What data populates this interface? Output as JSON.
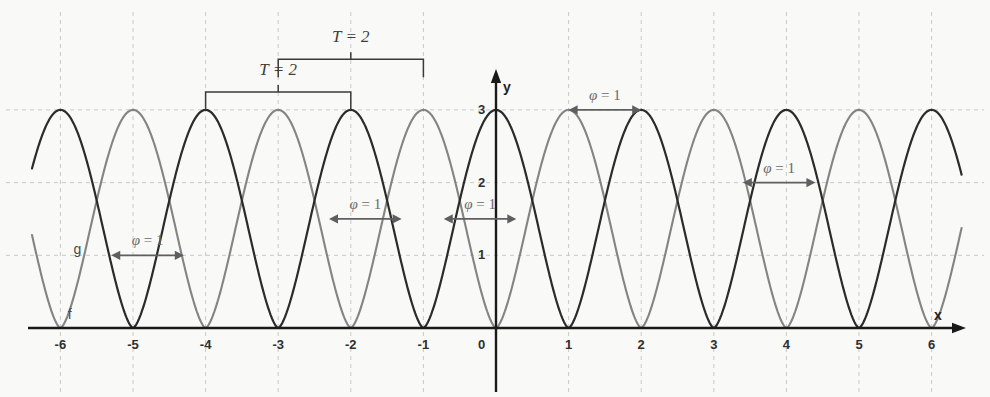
{
  "figure": {
    "background_color": "#f9f9f7",
    "axis_color": "#1a1a1a",
    "grid_color": "#c9c9c9",
    "x_axis_label": "x",
    "y_axis_label": "y",
    "curve_f": {
      "name": "f",
      "color": "#2b2b2b"
    },
    "curve_g": {
      "name": "g",
      "color": "#7d7d7d"
    }
  },
  "chart_data": {
    "type": "line",
    "title": "",
    "xlabel": "x",
    "ylabel": "y",
    "xlim": [
      -6.6,
      6.6
    ],
    "ylim": [
      0,
      3.3
    ],
    "grid": true,
    "legend_position": "inline-left",
    "x_ticks": [
      "-6",
      "-5",
      "-4",
      "-3",
      "-2",
      "-1",
      "0",
      "1",
      "2",
      "3",
      "4",
      "5",
      "6"
    ],
    "x_tick_values": [
      -6,
      -5,
      -4,
      -3,
      -2,
      -1,
      0,
      1,
      2,
      3,
      4,
      5,
      6
    ],
    "y_ticks": [
      "0",
      "1",
      "2",
      "3"
    ],
    "y_tick_values": [
      0,
      1,
      2,
      3
    ],
    "series": [
      {
        "name": "f",
        "color": "#2b2b2b",
        "description": "period-2 cusped wave, amplitude 3, maxima at even integers",
        "period": 2,
        "amplitude": 3,
        "maxima_x": [
          -6,
          -4,
          -2,
          0,
          2,
          4,
          6
        ],
        "minima_x": [
          -5,
          -3,
          -1,
          1,
          3,
          5
        ],
        "maxima_y": 3,
        "minima_y": 0
      },
      {
        "name": "g",
        "color": "#7d7d7d",
        "description": "period-2 cusped wave, amplitude 3, maxima at odd integers",
        "period": 2,
        "amplitude": 3,
        "maxima_x": [
          -5,
          -3,
          -1,
          1,
          3,
          5
        ],
        "minima_x": [
          -6,
          -4,
          -2,
          0,
          2,
          4,
          6
        ],
        "maxima_y": 3,
        "minima_y": 0
      }
    ],
    "annotations": [
      {
        "id": "period-bracket-lower",
        "text": "T = 2",
        "kind": "bracket",
        "from_x": -4,
        "to_x": -2,
        "at_y": 3.0
      },
      {
        "id": "period-bracket-upper",
        "text": "T = 2",
        "kind": "bracket",
        "from_x": -3,
        "to_x": -1,
        "at_y": 3.45
      },
      {
        "id": "phase-arrow-1",
        "text": "φ = 1",
        "kind": "double-arrow",
        "from_x": -5.3,
        "to_x": -4.3,
        "at_y": 1.0
      },
      {
        "id": "phase-arrow-2",
        "text": "φ = 1",
        "kind": "double-arrow",
        "from_x": -2.3,
        "to_x": -1.3,
        "at_y": 1.5
      },
      {
        "id": "phase-arrow-3",
        "text": "φ = 1",
        "kind": "double-arrow",
        "from_x": -0.72,
        "to_x": 0.28,
        "at_y": 1.5
      },
      {
        "id": "phase-arrow-4",
        "text": "φ = 1",
        "kind": "double-arrow",
        "from_x": 1.0,
        "to_x": 2.0,
        "at_y": 3.0
      },
      {
        "id": "phase-arrow-5",
        "text": "φ = 1",
        "kind": "double-arrow",
        "from_x": 3.4,
        "to_x": 4.4,
        "at_y": 2.0
      }
    ],
    "curve_labels": [
      {
        "id": "label-g",
        "text": "g",
        "x": -5.82,
        "y": 1.18
      },
      {
        "id": "label-f",
        "text": "f",
        "x": -5.9,
        "y": 0.29
      }
    ]
  }
}
